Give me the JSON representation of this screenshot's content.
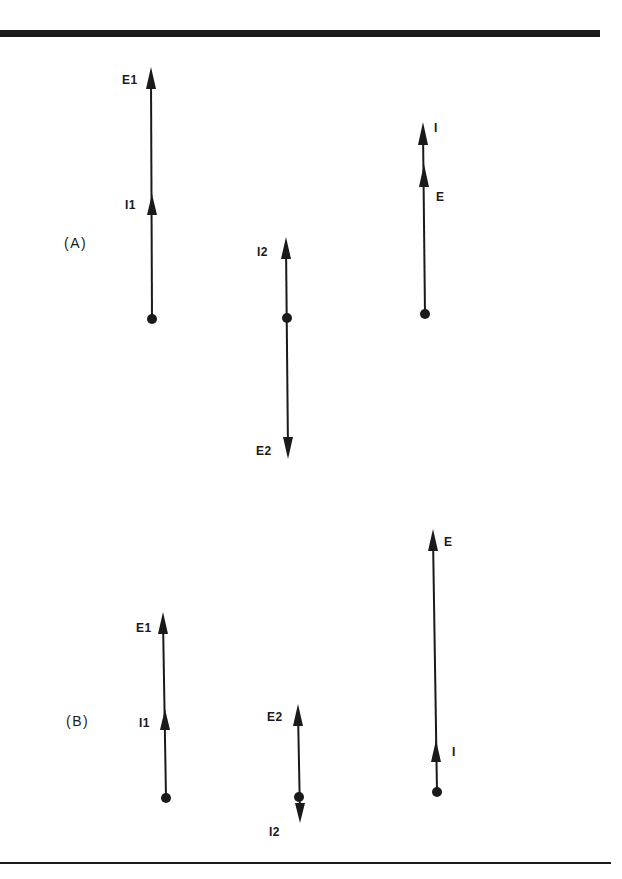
{
  "figure": {
    "colors": {
      "ink": "#1a1a1a",
      "background": "#ffffff"
    },
    "panels": [
      {
        "label": "(A)",
        "diagrams": [
          {
            "id": "A1",
            "vectors": [
              {
                "name": "E1",
                "label": "E1",
                "direction": "up"
              },
              {
                "name": "I1",
                "label": "I1",
                "direction": "up"
              }
            ]
          },
          {
            "id": "A2",
            "vectors": [
              {
                "name": "I2",
                "label": "I2",
                "direction": "up"
              },
              {
                "name": "E2",
                "label": "E2",
                "direction": "down"
              }
            ]
          },
          {
            "id": "A3",
            "vectors": [
              {
                "name": "I",
                "label": "I",
                "direction": "up"
              },
              {
                "name": "E",
                "label": "E",
                "direction": "up"
              }
            ]
          }
        ]
      },
      {
        "label": "(B)",
        "diagrams": [
          {
            "id": "B1",
            "vectors": [
              {
                "name": "E1",
                "label": "E1",
                "direction": "up"
              },
              {
                "name": "I1",
                "label": "I1",
                "direction": "up"
              }
            ]
          },
          {
            "id": "B2",
            "vectors": [
              {
                "name": "E2",
                "label": "E2",
                "direction": "up"
              },
              {
                "name": "I2",
                "label": "I2",
                "direction": "down"
              }
            ]
          },
          {
            "id": "B3",
            "vectors": [
              {
                "name": "E",
                "label": "E",
                "direction": "up"
              },
              {
                "name": "I",
                "label": "I",
                "direction": "up"
              }
            ]
          }
        ]
      }
    ]
  }
}
